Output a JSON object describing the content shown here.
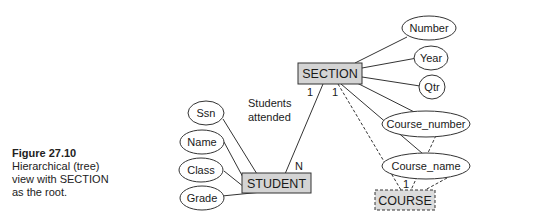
{
  "caption": {
    "figure": "Figure 27.10",
    "text": "Hierarchical (tree)\nview with SECTION\nas the root."
  },
  "diagram": {
    "root": {
      "label": "SECTION"
    },
    "student": {
      "label": "STUDENT"
    },
    "course": {
      "label": "COURSE"
    },
    "relationship_label": "Students\nattended",
    "relationship_label_line1": "Students",
    "relationship_label_line2": "attended",
    "cardinalities": {
      "section_student_section_side": "1",
      "section_student_student_side": "N",
      "section_course_section_side": "1",
      "section_course_course_side": "1"
    },
    "section_attributes": [
      "Number",
      "Year",
      "Qtr",
      "Course_number",
      "Course_name"
    ],
    "student_attributes": [
      "Ssn",
      "Name",
      "Class",
      "Grade"
    ],
    "colors": {
      "entity_fill": "#d4d4d4",
      "stroke": "#333333",
      "background": "#ffffff"
    }
  }
}
